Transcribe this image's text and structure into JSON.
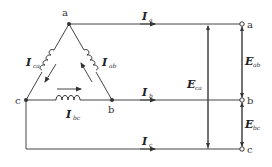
{
  "diagram": {
    "type": "delta-connected three-phase source circuit",
    "nodes": {
      "a": "a",
      "b": "b",
      "c": "c"
    },
    "terminals": {
      "a": "a",
      "b": "b",
      "c": "c"
    },
    "phase_currents": {
      "ab": {
        "symbol": "I",
        "sub": "ab"
      },
      "bc": {
        "symbol": "I",
        "sub": "bc"
      },
      "ca": {
        "symbol": "I",
        "sub": "ca"
      }
    },
    "line_currents": {
      "a": {
        "symbol": "I",
        "sub": "a"
      },
      "b": {
        "symbol": "I",
        "sub": "b"
      },
      "c": {
        "symbol": "I",
        "sub": "c"
      }
    },
    "voltages": {
      "ab": {
        "symbol": "E",
        "sub": "ab"
      },
      "bc": {
        "symbol": "E",
        "sub": "bc"
      },
      "ca": {
        "symbol": "E",
        "sub": "ca"
      }
    },
    "colors": {
      "line": "#444444",
      "text": "#222222"
    }
  }
}
